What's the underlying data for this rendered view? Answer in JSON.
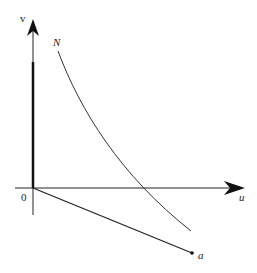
{
  "diagram": {
    "axes": {
      "y_label": "v",
      "x_label": "u",
      "origin_label": "0"
    },
    "curve_label": "N",
    "point_label": "a",
    "colors": {
      "ink": "#222222",
      "background": "#ffffff"
    }
  }
}
